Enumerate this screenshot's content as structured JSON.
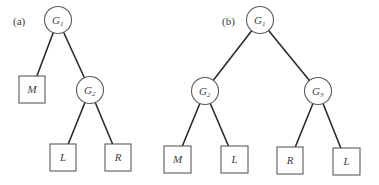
{
  "diagram": {
    "colors": {
      "background": "#ffffff",
      "edge": "#2b2b2b",
      "node_stroke": "#5a5a5a",
      "text": "#3f3f3f"
    },
    "panels": [
      {
        "label": "(a)",
        "nodes": [
          {
            "id": "G1",
            "shape": "circle",
            "main": "G",
            "sub": "1"
          },
          {
            "id": "M",
            "shape": "square",
            "main": "M"
          },
          {
            "id": "G2",
            "shape": "circle",
            "main": "G",
            "sub": "2"
          },
          {
            "id": "L",
            "shape": "square",
            "main": "L"
          },
          {
            "id": "R",
            "shape": "square",
            "main": "R"
          }
        ],
        "edges": [
          [
            "G1",
            "M"
          ],
          [
            "G1",
            "G2"
          ],
          [
            "G2",
            "L"
          ],
          [
            "G2",
            "R"
          ]
        ]
      },
      {
        "label": "(b)",
        "nodes": [
          {
            "id": "G1",
            "shape": "circle",
            "main": "G",
            "sub": "1"
          },
          {
            "id": "G2",
            "shape": "circle",
            "main": "G",
            "sub": "2"
          },
          {
            "id": "G3",
            "shape": "circle",
            "main": "G",
            "sub": "3"
          },
          {
            "id": "M",
            "shape": "square",
            "main": "M"
          },
          {
            "id": "L1",
            "shape": "square",
            "main": "L"
          },
          {
            "id": "R",
            "shape": "square",
            "main": "R"
          },
          {
            "id": "L2",
            "shape": "square",
            "main": "L"
          }
        ],
        "edges": [
          [
            "G1",
            "G2"
          ],
          [
            "G1",
            "G3"
          ],
          [
            "G2",
            "M"
          ],
          [
            "G2",
            "L1"
          ],
          [
            "G3",
            "R"
          ],
          [
            "G3",
            "L2"
          ]
        ]
      }
    ]
  }
}
